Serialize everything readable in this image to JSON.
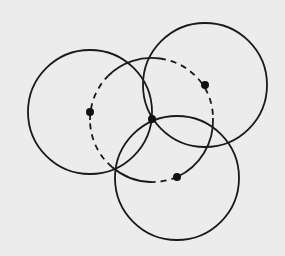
{
  "diagram": {
    "background": "#ececec",
    "stroke_color": "#1a1a1a",
    "circles": [
      {
        "id": "left",
        "cx": 90,
        "cy": 112,
        "r": 62,
        "style": "solid"
      },
      {
        "id": "top-right",
        "cx": 205,
        "cy": 85,
        "r": 62,
        "style": "solid"
      },
      {
        "id": "bottom",
        "cx": 177,
        "cy": 178,
        "r": 62,
        "style": "solid"
      },
      {
        "id": "center-dashed",
        "cx": 152,
        "cy": 120,
        "r": 62,
        "style": "partially-dashed"
      }
    ],
    "points": [
      {
        "id": "left-center",
        "x": 90,
        "y": 112
      },
      {
        "id": "top-right-center",
        "x": 205,
        "y": 85
      },
      {
        "id": "bottom-center",
        "x": 177,
        "y": 177
      },
      {
        "id": "common-intersection",
        "x": 152,
        "y": 119
      }
    ]
  }
}
